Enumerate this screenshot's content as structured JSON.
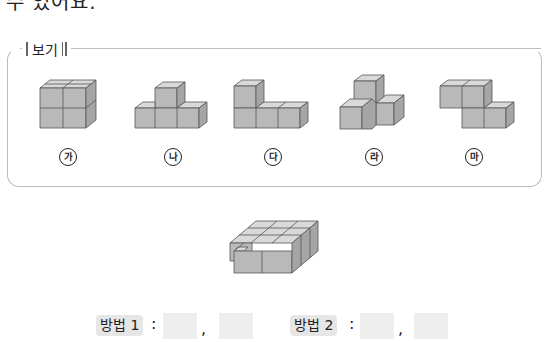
{
  "question": {
    "top_text_fragment": "수 있어요."
  },
  "example_box": {
    "legend_label": "보기",
    "items": [
      {
        "id": "ga",
        "label": "가",
        "shape": "2x2 square of cubes (4 cubes)"
      },
      {
        "id": "na",
        "label": "나",
        "shape": "row of 3 cubes with 1 on top center (4 cubes)"
      },
      {
        "id": "da",
        "label": "다",
        "shape": "row of 3 cubes with 1 on top left (4 cubes)"
      },
      {
        "id": "ra",
        "label": "라",
        "shape": "3D corner: 1 on top, 2 at base (4 cubes)"
      },
      {
        "id": "ma",
        "label": "마",
        "shape": "S/Z shape offset in depth (4 cubes)"
      }
    ]
  },
  "target_figure": {
    "description": "flat 3x3 layer of cubes with one front-left cube missing (8 cubes)"
  },
  "answers": {
    "method1_label": "방법 1",
    "method2_label": "방법 2",
    "colon": ":",
    "comma": ",",
    "method1_values": [
      "",
      ""
    ],
    "method2_values": [
      "",
      ""
    ]
  },
  "colors": {
    "cube_top": "#d9d9d9",
    "cube_front": "#b9b9b9",
    "cube_side": "#a5a5a5",
    "cube_edge": "#555555",
    "box_border": "#bdbdbd",
    "tag_bg": "#e6e6e6",
    "blank_bg": "#eeeeee"
  }
}
